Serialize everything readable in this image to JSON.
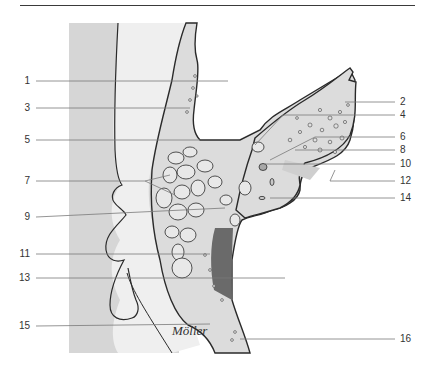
{
  "diagram": {
    "type": "anatomical cross-section illustration",
    "signature": "Möller",
    "colors": {
      "background_panel": "#d6d6d6",
      "light_region": "#ececec",
      "bone_fill": "#dcdcdc",
      "dark_cavity": "#6a6a6a",
      "outline": "#2a2a2a",
      "leader_line": "#7a7a7a"
    },
    "labels_left": [
      {
        "id": "1",
        "text": "1",
        "y": 81
      },
      {
        "id": "3",
        "text": "3",
        "y": 108
      },
      {
        "id": "5",
        "text": "5",
        "y": 140
      },
      {
        "id": "7",
        "text": "7",
        "y": 181
      },
      {
        "id": "9",
        "text": "9",
        "y": 217
      },
      {
        "id": "11",
        "text": "11",
        "y": 254
      },
      {
        "id": "13",
        "text": "13",
        "y": 278
      },
      {
        "id": "15",
        "text": "15",
        "y": 326
      }
    ],
    "labels_right": [
      {
        "id": "2",
        "text": "2",
        "y": 102
      },
      {
        "id": "4",
        "text": "4",
        "y": 115
      },
      {
        "id": "6",
        "text": "6",
        "y": 137
      },
      {
        "id": "8",
        "text": "8",
        "y": 150
      },
      {
        "id": "10",
        "text": "10",
        "y": 164
      },
      {
        "id": "12",
        "text": "12",
        "y": 181
      },
      {
        "id": "14",
        "text": "14",
        "y": 198
      },
      {
        "id": "16",
        "text": "16",
        "y": 339
      }
    ]
  }
}
